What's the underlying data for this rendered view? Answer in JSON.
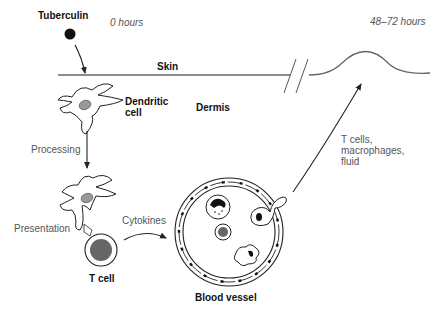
{
  "diagram": {
    "labels": {
      "tuberculin": "Tuberculin",
      "time_start": "0 hours",
      "time_end": "48–72 hours",
      "skin": "Skin",
      "dermis": "Dermis",
      "dendritic_cell": "Dendritic\ncell",
      "processing": "Processing",
      "presentation": "Presentation",
      "t_cell": "T cell",
      "cytokines": "Cytokines",
      "blood_vessel": "Blood vessel",
      "infiltrate": "T cells,\nmacrophages,\nfluid"
    },
    "colors": {
      "line": "#333333",
      "skin_line": "#555555",
      "nucleus": "#999999",
      "tcell_nucleus": "#666666",
      "dot": "#111111"
    }
  }
}
